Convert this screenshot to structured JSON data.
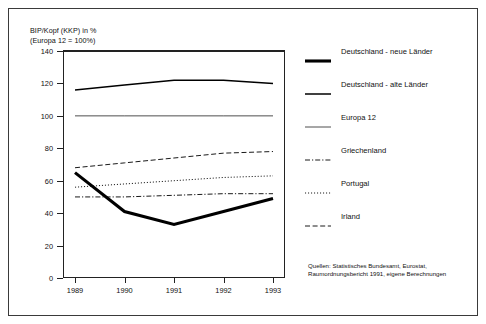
{
  "axis_title": "BIP/Kopf (KKP) in %\n(Europa 12 = 100%)",
  "legend": [
    {
      "label": "Deutschland - neue Länder",
      "style": "thick-solid",
      "icon": "line-thick-solid-icon"
    },
    {
      "label": "Deutschland - alte Länder",
      "style": "medium-solid",
      "icon": "line-medium-solid-icon"
    },
    {
      "label": "Europa 12",
      "style": "thin-solid",
      "icon": "line-thin-solid-icon"
    },
    {
      "label": "Griechenland",
      "style": "dash-dot",
      "icon": "line-dash-dot-icon"
    },
    {
      "label": "Portugal",
      "style": "dotted",
      "icon": "line-dotted-icon"
    },
    {
      "label": "Irland",
      "style": "dashed",
      "icon": "line-dashed-icon"
    }
  ],
  "source_note": "Quellen: Statistisches Bundesamt, Eurostat, Raumordnungsbericht 1991, eigene Berechnungen",
  "chart_data": {
    "type": "line",
    "title": "BIP/Kopf (KKP) in % (Europa 12 = 100%)",
    "xlabel": "",
    "ylabel": "BIP/Kopf (KKP) in %",
    "x": [
      "1989",
      "1990",
      "1991",
      "1992",
      "1993"
    ],
    "xlim": [
      1989,
      1993
    ],
    "ylim": [
      0,
      140
    ],
    "yticks": [
      0,
      20,
      40,
      60,
      80,
      100,
      120,
      140
    ],
    "ytick_labels": [
      "0",
      "20",
      "40",
      "60",
      "80",
      "100",
      "120",
      "140"
    ],
    "grid": false,
    "legend_position": "right",
    "series": [
      {
        "name": "Deutschland - neue Länder",
        "style": "thick-solid",
        "values": [
          65,
          41,
          33,
          41,
          49
        ]
      },
      {
        "name": "Deutschland - alte Länder",
        "style": "medium-solid",
        "values": [
          116,
          119,
          122,
          122,
          120
        ]
      },
      {
        "name": "Europa 12",
        "style": "thin-solid",
        "values": [
          100,
          100,
          100,
          100,
          100
        ]
      },
      {
        "name": "Griechenland",
        "style": "dash-dot",
        "values": [
          50,
          50,
          51,
          52,
          52
        ]
      },
      {
        "name": "Portugal",
        "style": "dotted",
        "values": [
          56,
          58,
          60,
          62,
          63
        ]
      },
      {
        "name": "Irland",
        "style": "dashed",
        "values": [
          68,
          71,
          74,
          77,
          78
        ]
      }
    ]
  }
}
